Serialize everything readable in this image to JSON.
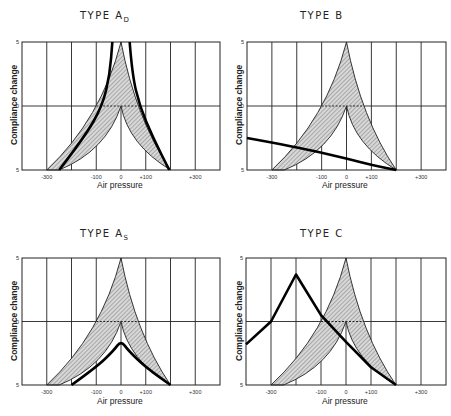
{
  "chart_data": [
    {
      "type": "line",
      "title": "TYPE A",
      "title_subscript": "D",
      "xlabel": "Air pressure",
      "ylabel": "Compliance change",
      "xlim": [
        -400,
        400
      ],
      "x_tick_labels": [
        "-300",
        "-100",
        "0",
        "+100",
        "+300"
      ],
      "x_ticks": [
        -300,
        -100,
        0,
        100,
        300
      ],
      "y_tick_labels": [
        "5",
        "0",
        "5"
      ],
      "grid": true,
      "normal_region": {
        "outer": [
          [
            -300,
            -5
          ],
          [
            -200,
            -3
          ],
          [
            -100,
            0
          ],
          [
            0,
            5
          ],
          [
            100,
            0
          ],
          [
            200,
            -5
          ]
        ],
        "inner": [
          [
            -250,
            -5
          ],
          [
            -150,
            -3
          ],
          [
            0,
            0
          ],
          [
            100,
            -3
          ],
          [
            200,
            -5
          ]
        ]
      },
      "series": [
        {
          "name": "left curve",
          "points": [
            [
              -250,
              -5
            ],
            [
              -150,
              -2.5
            ],
            [
              -75,
              0
            ],
            [
              -45,
              2.5
            ],
            [
              -35,
              5
            ]
          ]
        },
        {
          "name": "right curve",
          "points": [
            [
              35,
              5
            ],
            [
              45,
              2.5
            ],
            [
              75,
              0
            ],
            [
              130,
              -2.5
            ],
            [
              195,
              -5
            ]
          ]
        }
      ]
    },
    {
      "type": "line",
      "title": "TYPE B",
      "xlabel": "Air pressure",
      "ylabel": "Compliance change",
      "xlim": [
        -400,
        400
      ],
      "x_tick_labels": [
        "-300",
        "-100",
        "0",
        "+100",
        "+300"
      ],
      "y_tick_labels": [
        "5",
        "0",
        "5"
      ],
      "grid": true,
      "series": [
        {
          "name": "flat curve",
          "points": [
            [
              -400,
              -2.5
            ],
            [
              -200,
              -3.2
            ],
            [
              0,
              -4.1
            ],
            [
              100,
              -4.6
            ],
            [
              200,
              -5
            ]
          ]
        }
      ]
    },
    {
      "type": "line",
      "title": "TYPE A",
      "title_subscript": "S",
      "xlabel": "Air pressure",
      "ylabel": "Compliance change",
      "xlim": [
        -400,
        400
      ],
      "x_tick_labels": [
        "-300",
        "-100",
        "0",
        "+100",
        "+300"
      ],
      "y_tick_labels": [
        "5",
        "0",
        "5"
      ],
      "grid": true,
      "series": [
        {
          "name": "shallow peak",
          "points": [
            [
              -200,
              -5
            ],
            [
              -100,
              -3.6
            ],
            [
              -30,
              -2.3
            ],
            [
              0,
              -1.5
            ],
            [
              30,
              -2.3
            ],
            [
              100,
              -3.6
            ],
            [
              200,
              -5
            ]
          ]
        }
      ]
    },
    {
      "type": "line",
      "title": "TYPE C",
      "xlabel": "Air pressure",
      "ylabel": "Compliance change",
      "xlim": [
        -400,
        400
      ],
      "x_tick_labels": [
        "-300",
        "-100",
        "0",
        "+100",
        "+300"
      ],
      "y_tick_labels": [
        "5",
        "0",
        "5"
      ],
      "grid": true,
      "series": [
        {
          "name": "shifted peak",
          "points": [
            [
              -400,
              -1.8
            ],
            [
              -300,
              0
            ],
            [
              -200,
              3.7
            ],
            [
              -100,
              0.5
            ],
            [
              0,
              -1.6
            ],
            [
              100,
              -3.6
            ],
            [
              200,
              -5
            ]
          ]
        }
      ]
    }
  ],
  "panels": [
    {
      "title": "TYPE A",
      "sub": "D",
      "xlabel": "Air pressure",
      "ylabel": "Compliance change"
    },
    {
      "title": "TYPE B",
      "sub": "",
      "xlabel": "Air pressure",
      "ylabel": "Compliance change"
    },
    {
      "title": "TYPE A",
      "sub": "S",
      "xlabel": "Air pressure",
      "ylabel": "Compliance change"
    },
    {
      "title": "TYPE C",
      "sub": "",
      "xlabel": "Air pressure",
      "ylabel": "Compliance change"
    }
  ],
  "ticks": {
    "x": [
      "-300",
      "-100",
      "0",
      "+100",
      "+300"
    ],
    "y_top": "5",
    "y_mid": "0",
    "y_bot": "5"
  }
}
